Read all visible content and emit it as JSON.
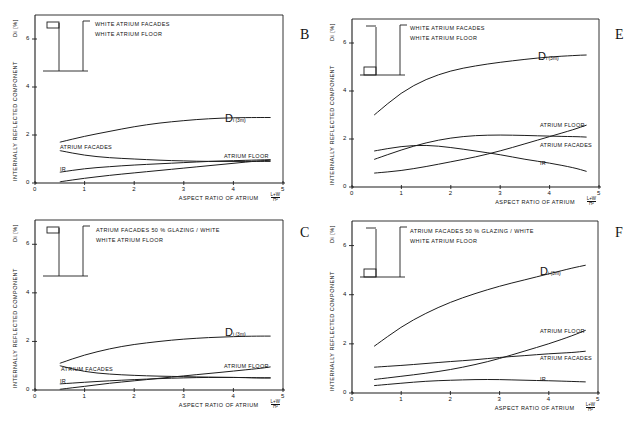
{
  "figure": {
    "panels": [
      {
        "id": "B",
        "letter": "B",
        "legend": [
          "WHITE  ATRIUM  FACADES",
          "WHITE  ATRIUM  FLOOR"
        ]
      },
      {
        "id": "E",
        "letter": "E",
        "legend": [
          "WHITE  ATRIUM  FACADES",
          "WHITE  ATRIUM  FLOOR"
        ]
      },
      {
        "id": "C",
        "letter": "C",
        "legend": [
          "ATRIUM  FACADES   50 %  GLAZING / WHITE",
          "WHITE  ATRIUM  FLOOR"
        ]
      },
      {
        "id": "F",
        "letter": "F",
        "legend": [
          "ATRIUM  FACADES   50 %  GLAZING / WHITE",
          "WHITE  ATRIUM  FLOOR"
        ]
      }
    ],
    "ylabel": "INTERNALLY  REFLECTED  COMPONENT",
    "ylabel_symbol": "Di  [%]",
    "xlabel": "ASPECT  RATIO  OF  ATRIUM",
    "x_unit_top": "L+W",
    "x_unit_bottom": "H²",
    "x_ticks": [
      "0",
      "1",
      "2",
      "3",
      "4",
      "5"
    ],
    "y_ticks": [
      "0",
      "2",
      "4",
      "6"
    ],
    "labels": {
      "di": "Di",
      "di_sub": "(3m)",
      "facades": "ATRIUM  FACADES",
      "floor": "ATRIUM  FLOOR",
      "ir": "IR"
    }
  },
  "chart_data": [
    {
      "panel": "B",
      "type": "line",
      "title": "WHITE ATRIUM FACADES / WHITE ATRIUM FLOOR",
      "xlabel": "ASPECT RATIO OF ATRIUM (L+W)/H²",
      "ylabel": "INTERNALLY REFLECTED COMPONENT Di [%]",
      "xlim": [
        0,
        5
      ],
      "ylim": [
        0,
        7
      ],
      "grid": false,
      "x": [
        0.5,
        1,
        1.5,
        2,
        2.5,
        3,
        3.5,
        4,
        4.5,
        4.75
      ],
      "series": [
        {
          "name": "Di (3m)",
          "values": [
            1.7,
            1.95,
            2.15,
            2.35,
            2.5,
            2.6,
            2.68,
            2.72,
            2.73,
            2.73
          ]
        },
        {
          "name": "ATRIUM FACADES",
          "values": [
            1.35,
            1.15,
            1.05,
            1.0,
            0.95,
            0.92,
            0.9,
            0.9,
            0.9,
            0.9
          ]
        },
        {
          "name": "IR",
          "values": [
            0.45,
            0.6,
            0.68,
            0.75,
            0.8,
            0.85,
            0.9,
            0.93,
            0.96,
            0.97
          ]
        },
        {
          "name": "ATRIUM FLOOR",
          "values": [
            0.05,
            0.2,
            0.32,
            0.42,
            0.52,
            0.62,
            0.72,
            0.82,
            0.92,
            0.95
          ]
        }
      ]
    },
    {
      "panel": "E",
      "type": "line",
      "title": "WHITE ATRIUM FACADES / WHITE ATRIUM FLOOR",
      "xlabel": "ASPECT RATIO OF ATRIUM (L+W)/H²",
      "ylabel": "INTERNALLY REFLECTED COMPONENT Di [%]",
      "xlim": [
        0,
        5
      ],
      "ylim": [
        0,
        7
      ],
      "grid": false,
      "x": [
        0.45,
        1,
        1.5,
        2,
        2.5,
        3,
        3.5,
        4,
        4.5,
        4.75
      ],
      "series": [
        {
          "name": "Di (3m)",
          "values": [
            3.0,
            3.95,
            4.5,
            4.85,
            5.05,
            5.2,
            5.32,
            5.42,
            5.48,
            5.5
          ]
        },
        {
          "name": "ATRIUM FACADES",
          "values": [
            1.15,
            1.55,
            1.85,
            2.05,
            2.15,
            2.17,
            2.15,
            2.12,
            2.1,
            2.08
          ]
        },
        {
          "name": "IR",
          "values": [
            1.5,
            1.7,
            1.75,
            1.65,
            1.5,
            1.35,
            1.15,
            1.0,
            0.8,
            0.65
          ]
        },
        {
          "name": "ATRIUM FLOOR",
          "values": [
            0.58,
            0.68,
            0.85,
            1.05,
            1.25,
            1.5,
            1.8,
            2.1,
            2.4,
            2.58
          ]
        }
      ]
    },
    {
      "panel": "C",
      "type": "line",
      "title": "ATRIUM FACADES 50% GLAZING / WHITE; WHITE ATRIUM FLOOR",
      "xlabel": "ASPECT RATIO OF ATRIUM (L+W)/H²",
      "ylabel": "INTERNALLY REFLECTED COMPONENT Di [%]",
      "xlim": [
        0,
        5
      ],
      "ylim": [
        0,
        7
      ],
      "grid": false,
      "x": [
        0.5,
        1,
        1.5,
        2,
        2.5,
        3,
        3.5,
        4,
        4.5,
        4.75
      ],
      "series": [
        {
          "name": "Di (3m)",
          "values": [
            1.1,
            1.45,
            1.7,
            1.88,
            2.0,
            2.1,
            2.16,
            2.2,
            2.22,
            2.22
          ]
        },
        {
          "name": "ATRIUM FACADES",
          "values": [
            1.0,
            0.75,
            0.65,
            0.6,
            0.57,
            0.55,
            0.53,
            0.52,
            0.5,
            0.5
          ]
        },
        {
          "name": "IR",
          "values": [
            0.25,
            0.32,
            0.38,
            0.43,
            0.47,
            0.5,
            0.52,
            0.52,
            0.5,
            0.5
          ]
        },
        {
          "name": "ATRIUM FLOOR",
          "values": [
            0.03,
            0.15,
            0.28,
            0.38,
            0.48,
            0.58,
            0.68,
            0.78,
            0.88,
            0.95
          ]
        }
      ]
    },
    {
      "panel": "F",
      "type": "line",
      "title": "ATRIUM FACADES 50% GLAZING / WHITE; WHITE ATRIUM FLOOR",
      "xlabel": "ASPECT RATIO OF ATRIUM (L+W)/H²",
      "ylabel": "INTERNALLY REFLECTED COMPONENT Di [%]",
      "xlim": [
        0,
        5
      ],
      "ylim": [
        0,
        7
      ],
      "grid": false,
      "x": [
        0.45,
        1,
        1.5,
        2,
        2.5,
        3,
        3.5,
        4,
        4.5,
        4.75
      ],
      "series": [
        {
          "name": "Di (3m)",
          "values": [
            1.9,
            2.7,
            3.25,
            3.7,
            4.05,
            4.35,
            4.6,
            4.85,
            5.1,
            5.2
          ]
        },
        {
          "name": "ATRIUM FACADES",
          "values": [
            1.05,
            1.12,
            1.2,
            1.28,
            1.35,
            1.45,
            1.52,
            1.6,
            1.65,
            1.7
          ]
        },
        {
          "name": "ATRIUM FLOOR",
          "values": [
            0.55,
            0.68,
            0.8,
            0.95,
            1.15,
            1.4,
            1.7,
            2.0,
            2.35,
            2.55
          ]
        },
        {
          "name": "IR",
          "values": [
            0.3,
            0.4,
            0.48,
            0.52,
            0.55,
            0.55,
            0.52,
            0.5,
            0.47,
            0.45
          ]
        }
      ]
    }
  ]
}
